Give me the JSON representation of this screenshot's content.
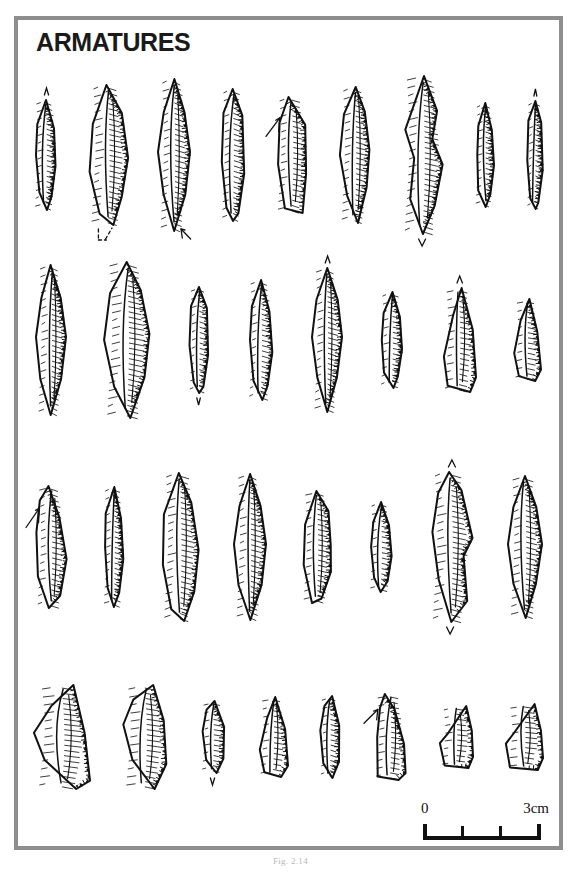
{
  "plate": {
    "title": "ARMATURES",
    "caption": "Fig. 2.14",
    "frame_color": "#8e8e8e",
    "ink_color": "#111111",
    "background_color": "#ffffff"
  },
  "scale_bar": {
    "min_label": "0",
    "max_label": "3cm",
    "unit": "cm",
    "ticks": [
      0,
      1,
      2,
      3
    ],
    "length_cm": 3
  },
  "chart_data": {
    "type": "table",
    "title": "ARMATURES",
    "rows": [
      {
        "row": 1,
        "count": 9,
        "items": [
          {
            "id": "r1-1",
            "shape": "backed-point",
            "height": 110,
            "width": 26,
            "annotation": "apex-arrow-up",
            "tilt": 0
          },
          {
            "id": "r1-2",
            "shape": "backed-point-broad",
            "height": 140,
            "width": 40,
            "annotation": "dashed-L",
            "tilt": 0
          },
          {
            "id": "r1-3",
            "shape": "bipointed-blade",
            "height": 152,
            "width": 32,
            "annotation": "tip-arrow",
            "tilt": 0
          },
          {
            "id": "r1-4",
            "shape": "backed-bladelet",
            "height": 132,
            "width": 26,
            "annotation": "none",
            "tilt": 0
          },
          {
            "id": "r1-5",
            "shape": "truncated-point",
            "height": 116,
            "width": 34,
            "annotation": "edge-arrow",
            "tilt": 0
          },
          {
            "id": "r1-6",
            "shape": "leaf-point",
            "height": 136,
            "width": 32,
            "annotation": "none",
            "tilt": 0
          },
          {
            "id": "r1-7",
            "shape": "double-backed-point",
            "height": 158,
            "width": 44,
            "annotation": "base-chevron",
            "tilt": 0
          },
          {
            "id": "r1-8",
            "shape": "narrow-backed-point",
            "height": 104,
            "width": 22,
            "annotation": "none",
            "tilt": 0
          },
          {
            "id": "r1-9",
            "shape": "slender-bladelet",
            "height": 108,
            "width": 18,
            "annotation": "apex-arrow-up",
            "tilt": 0
          }
        ]
      },
      {
        "row": 2,
        "count": 8,
        "items": [
          {
            "id": "r2-1",
            "shape": "bipointed-blade",
            "height": 150,
            "width": 30,
            "annotation": "none",
            "tilt": 0
          },
          {
            "id": "r2-2",
            "shape": "broad-leaf-point",
            "height": 156,
            "width": 48,
            "annotation": "none",
            "tilt": 0
          },
          {
            "id": "r2-3",
            "shape": "short-bladelet",
            "height": 106,
            "width": 22,
            "annotation": "base-chevron",
            "tilt": 0
          },
          {
            "id": "r2-4",
            "shape": "backed-point",
            "height": 120,
            "width": 28,
            "annotation": "none",
            "tilt": 0
          },
          {
            "id": "r2-5",
            "shape": "bipointed-blade",
            "height": 144,
            "width": 30,
            "annotation": "apex-arrow-up",
            "tilt": 0
          },
          {
            "id": "r2-6",
            "shape": "small-backed-point",
            "height": 96,
            "width": 26,
            "annotation": "none",
            "tilt": 0
          },
          {
            "id": "r2-7",
            "shape": "triangle-point",
            "height": 104,
            "width": 34,
            "annotation": "apex-arrow-up",
            "tilt": 0
          },
          {
            "id": "r2-8",
            "shape": "small-triangle",
            "height": 82,
            "width": 28,
            "annotation": "none",
            "tilt": 0
          }
        ]
      },
      {
        "row": 3,
        "count": 8,
        "items": [
          {
            "id": "r3-1",
            "shape": "curved-backed-point",
            "height": 122,
            "width": 32,
            "annotation": "edge-arrow",
            "tilt": 0
          },
          {
            "id": "r3-2",
            "shape": "narrow-backed-point",
            "height": 120,
            "width": 24,
            "annotation": "none",
            "tilt": 0
          },
          {
            "id": "r3-3",
            "shape": "large-backed-point",
            "height": 148,
            "width": 38,
            "annotation": "none",
            "tilt": 0
          },
          {
            "id": "r3-4",
            "shape": "bipointed-blade",
            "height": 146,
            "width": 32,
            "annotation": "none",
            "tilt": 0
          },
          {
            "id": "r3-5",
            "shape": "irregular-point",
            "height": 112,
            "width": 32,
            "annotation": "none",
            "tilt": 0
          },
          {
            "id": "r3-6",
            "shape": "small-backed-point",
            "height": 90,
            "width": 26,
            "annotation": "none",
            "tilt": 0
          },
          {
            "id": "r3-7",
            "shape": "shouldered-point",
            "height": 150,
            "width": 44,
            "annotation": "apex-and-base-chevron",
            "tilt": 0
          },
          {
            "id": "r3-8",
            "shape": "bipointed-blade",
            "height": 142,
            "width": 34,
            "annotation": "none",
            "tilt": 0
          }
        ]
      },
      {
        "row": 4,
        "count": 8,
        "items": [
          {
            "id": "r4-1",
            "shape": "large-triangle",
            "height": 104,
            "width": 56,
            "annotation": "none",
            "tilt": 0
          },
          {
            "id": "r4-2",
            "shape": "crescent-triangle",
            "height": 104,
            "width": 46,
            "annotation": "none",
            "tilt": 0
          },
          {
            "id": "r4-3",
            "shape": "small-segment",
            "height": 72,
            "width": 26,
            "annotation": "base-chevron",
            "tilt": 0
          },
          {
            "id": "r4-4",
            "shape": "small-triangle",
            "height": 80,
            "width": 30,
            "annotation": "none",
            "tilt": 0
          },
          {
            "id": "r4-5",
            "shape": "narrow-crescent",
            "height": 82,
            "width": 22,
            "annotation": "none",
            "tilt": 0
          },
          {
            "id": "r4-6",
            "shape": "truncated-trapeze",
            "height": 86,
            "width": 34,
            "annotation": "edge-arrow",
            "tilt": 0
          },
          {
            "id": "r4-7",
            "shape": "trapeze",
            "height": 62,
            "width": 34,
            "annotation": "none",
            "tilt": 0
          },
          {
            "id": "r4-8",
            "shape": "trapeze-wide",
            "height": 66,
            "width": 38,
            "annotation": "none",
            "tilt": 0
          }
        ]
      }
    ],
    "total_artifacts": 33,
    "xlabel": "",
    "ylabel": ""
  }
}
